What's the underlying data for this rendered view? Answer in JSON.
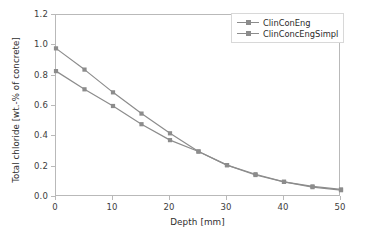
{
  "chart_data": {
    "type": "line",
    "title": "",
    "xlabel": "Depth [mm]",
    "ylabel": "Total chloride [wt.-% of concrete]",
    "xlim": [
      0,
      50
    ],
    "ylim": [
      0.0,
      1.2
    ],
    "xticks": [
      "0",
      "10",
      "20",
      "30",
      "40",
      "50"
    ],
    "xtick_values": [
      0,
      10,
      20,
      30,
      40,
      50
    ],
    "yticks": [
      "0.0",
      "0.2",
      "0.4",
      "0.6",
      "0.8",
      "1.0",
      "1.2"
    ],
    "ytick_values": [
      0.0,
      0.2,
      0.4,
      0.6,
      0.8,
      1.0,
      1.2
    ],
    "grid": false,
    "legend_position": "upper right",
    "x": [
      0,
      5,
      10,
      15,
      20,
      25,
      30,
      35,
      40,
      45,
      50
    ],
    "series": [
      {
        "name": "ClinConEng",
        "color": "#8c8c8c",
        "marker": "square",
        "values": [
          0.98,
          0.84,
          0.69,
          0.55,
          0.42,
          0.3,
          0.21,
          0.15,
          0.1,
          0.07,
          0.05
        ]
      },
      {
        "name": "ClinConcEngSimpl",
        "color": "#8c8c8c",
        "marker": "square",
        "values": [
          0.83,
          0.71,
          0.6,
          0.48,
          0.375,
          0.3,
          0.21,
          0.145,
          0.1,
          0.065,
          0.045
        ]
      }
    ]
  },
  "legend": {
    "entries": [
      {
        "label": "ClinConEng"
      },
      {
        "label": "ClinConcEngSimpl"
      }
    ]
  },
  "colors": {
    "line": "#8c8c8c",
    "axis": "#b9b9b9",
    "text": "#2e2e2e",
    "background": "#ffffff"
  }
}
